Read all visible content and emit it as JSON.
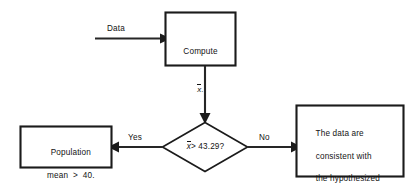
{
  "diagram": {
    "type": "flowchart",
    "background_color": "#ffffff",
    "stroke_color": "#1b1b1b",
    "text_color": "#131313"
  },
  "nodes": {
    "compute": {
      "shape": "rectangle",
      "line1": "Compute",
      "line2": "x",
      "line2_suffix": "."
    },
    "decision": {
      "shape": "diamond",
      "var": "x",
      "condition": "> 43.29?"
    },
    "left_result": {
      "shape": "rectangle",
      "line1": "Population",
      "line2": "mean  >  40."
    },
    "right_result": {
      "shape": "rectangle",
      "line1": "The data are",
      "line2": "consistent with",
      "line3": "the hypothesized",
      "line4": "value of 40 hours."
    }
  },
  "edges": {
    "input_label": "Data",
    "yes_label": "Yes",
    "no_label": "No"
  }
}
